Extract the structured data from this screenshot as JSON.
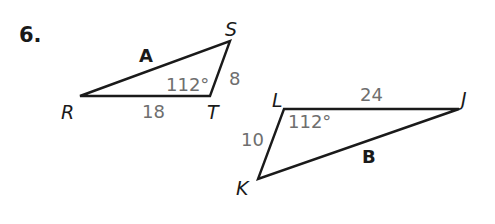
{
  "problem": {
    "number": "6."
  },
  "triangle_a": {
    "name": "A",
    "vertices": {
      "R": "R",
      "S": "S",
      "T": "T"
    },
    "angle_T": "112°",
    "side_RT": "18",
    "side_ST": "8"
  },
  "triangle_b": {
    "name": "B",
    "vertices": {
      "L": "L",
      "J": "J",
      "K": "K"
    },
    "angle_L": "112°",
    "side_LJ": "24",
    "side_LK": "10"
  },
  "colors": {
    "line": "#1a1a1a",
    "measure_text": "#6e6e6e",
    "background": "#ffffff"
  }
}
